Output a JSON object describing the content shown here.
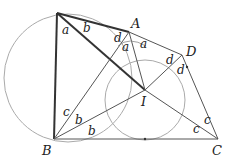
{
  "diagram": {
    "type": "geometry",
    "points": {
      "P": {
        "x": 57,
        "y": 13,
        "label": ""
      },
      "A": {
        "x": 129,
        "y": 32,
        "label": "A"
      },
      "D": {
        "x": 182,
        "y": 55,
        "label": "D"
      },
      "I": {
        "x": 145,
        "y": 90,
        "label": "I"
      },
      "B": {
        "x": 54,
        "y": 139,
        "label": "B"
      },
      "C": {
        "x": 218,
        "y": 139,
        "label": "C"
      }
    },
    "angle_labels": [
      {
        "text": "a",
        "x": 62,
        "y": 34
      },
      {
        "text": "b",
        "x": 83,
        "y": 32
      },
      {
        "text": "d",
        "x": 114,
        "y": 42
      },
      {
        "text": "a",
        "x": 122,
        "y": 51
      },
      {
        "text": "a",
        "x": 140,
        "y": 48
      },
      {
        "text": "d",
        "x": 166,
        "y": 64
      },
      {
        "text": "d",
        "x": 177,
        "y": 74
      },
      {
        "text": "c",
        "x": 63,
        "y": 116
      },
      {
        "text": "b",
        "x": 75,
        "y": 124
      },
      {
        "text": "b",
        "x": 88,
        "y": 135
      },
      {
        "text": "c",
        "x": 204,
        "y": 124
      },
      {
        "text": "c",
        "x": 193,
        "y": 133
      }
    ],
    "colors": {
      "thick": "#333333",
      "thin": "#555555",
      "circle": "#aaaaaa"
    }
  }
}
